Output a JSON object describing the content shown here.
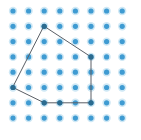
{
  "figure": {
    "kind": "dot-grid-lattice-polygon",
    "canvas": {
      "width": 141,
      "height": 140,
      "background_color": "#ffffff"
    },
    "grid": {
      "name": "dot-lattice",
      "columns": 8,
      "rows": 8,
      "origin_x": 13,
      "origin_y": 11,
      "spacing_x": 15.6,
      "spacing_y": 15.3,
      "dot_radius": 2.6,
      "dot_color": "#3f9bd2",
      "dot_halo_color": "#cfe8f5",
      "dot_halo_radius": 4.2,
      "dot_count": 64
    },
    "polygon": {
      "name": "pentagon",
      "sides": 5,
      "stroke_color": "#5a5f66",
      "stroke_width": 1.0,
      "fill": "none",
      "vertices_grid": [
        {
          "label": "top",
          "col": 2,
          "row": 1
        },
        {
          "label": "right",
          "col": 5,
          "row": 3
        },
        {
          "label": "bottom-right",
          "col": 5,
          "row": 6
        },
        {
          "label": "bottom-left",
          "col": 2,
          "row": 6
        },
        {
          "label": "left",
          "col": 0,
          "row": 5
        }
      ],
      "vertices_px": [
        {
          "x": 44.2,
          "y": 26.3
        },
        {
          "x": 91.0,
          "y": 56.9
        },
        {
          "x": 91.0,
          "y": 102.8
        },
        {
          "x": 44.2,
          "y": 102.8
        },
        {
          "x": 13.0,
          "y": 87.5
        }
      ],
      "vertex_marker_color": "#2b6b8f",
      "vertex_marker_radius": 2.6
    },
    "edge_midpoint_marker": {
      "name": "bottom-edge-lattice-point",
      "col": 3,
      "row": 6,
      "x": 59.8,
      "y": 102.8
    }
  }
}
